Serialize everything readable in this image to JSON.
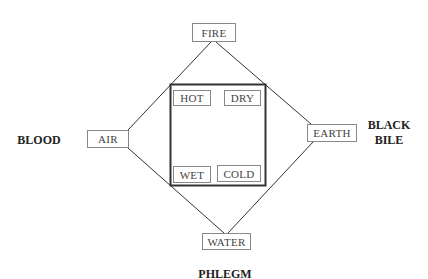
{
  "diagram": {
    "title": "",
    "elements": {
      "fire": "FIRE",
      "air": "AIR",
      "earth": "EARTH",
      "water": "WATER"
    },
    "qualities": {
      "hot": "HOT",
      "dry": "DRY",
      "wet": "WET",
      "cold": "COLD"
    },
    "humors": {
      "blood": "BLOOD",
      "black_bile_line1": "BLACK",
      "black_bile_line2": "BILE",
      "phlegm": "PHLEGM"
    },
    "colors": {
      "line": "#333333",
      "box_border": "#888888",
      "square_border": "#333333",
      "text": "#444444",
      "humor_text": "#222222"
    }
  }
}
